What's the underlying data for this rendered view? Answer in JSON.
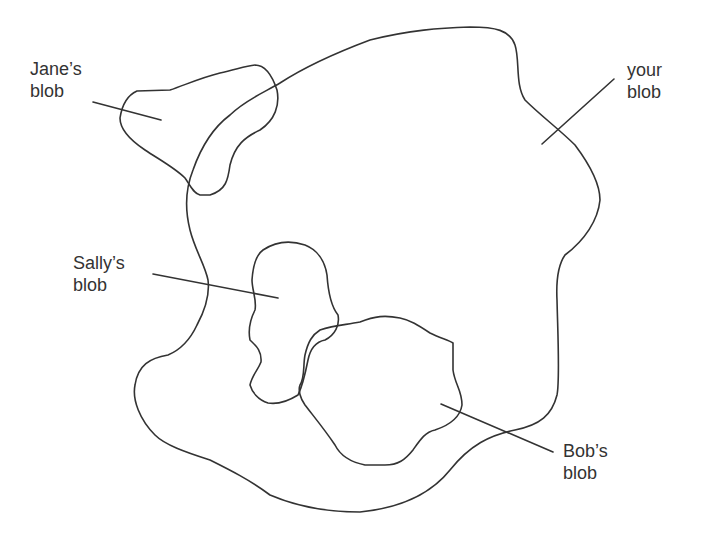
{
  "diagram": {
    "type": "overlapping-regions",
    "line_color": "#333333",
    "background": "#ffffff",
    "labels": {
      "jane": {
        "line1": "Jane’s",
        "line2": "blob"
      },
      "your": {
        "line1": "your",
        "line2": "blob"
      },
      "sally": {
        "line1": "Sally’s",
        "line2": "blob"
      },
      "bob": {
        "line1": "Bob’s",
        "line2": "blob"
      }
    }
  }
}
